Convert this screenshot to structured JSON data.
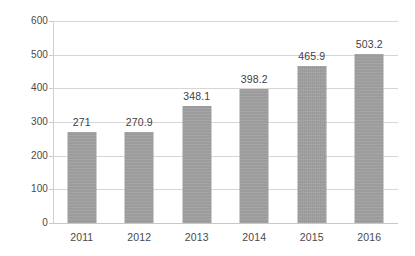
{
  "chart_data": {
    "type": "bar",
    "title": "",
    "subtitle": "",
    "xlabel": "",
    "ylabel": "",
    "categories": [
      "2011",
      "2012",
      "2013",
      "2014",
      "2015",
      "2016"
    ],
    "values": [
      271,
      270.9,
      348.1,
      398.2,
      465.9,
      503.2
    ],
    "data_labels": [
      "271",
      "270.9",
      "348.1",
      "398.2",
      "465.9",
      "503.2"
    ],
    "series": [
      {
        "name": "",
        "values": [
          271,
          270.9,
          348.1,
          398.2,
          465.9,
          503.2
        ]
      }
    ],
    "ylim": [
      0,
      600
    ],
    "yticks": [
      0,
      100,
      200,
      300,
      400,
      500,
      600
    ],
    "ytick_labels": [
      "0",
      "100",
      "200",
      "300",
      "400",
      "500",
      "600"
    ],
    "xtick_labels": [
      "2011",
      "2012",
      "2013",
      "2014",
      "2015",
      "2016"
    ],
    "grid": true,
    "grid_axis": "y",
    "legend": false,
    "legend_position": "none",
    "annotations": [],
    "colors": {
      "bar": "#9e9e9e",
      "gridline": "#d6d6d6",
      "axis": "#c8c8c8",
      "text": "#4a4a4a",
      "label_text": "#3f3f3f",
      "background": "#ffffff"
    }
  }
}
